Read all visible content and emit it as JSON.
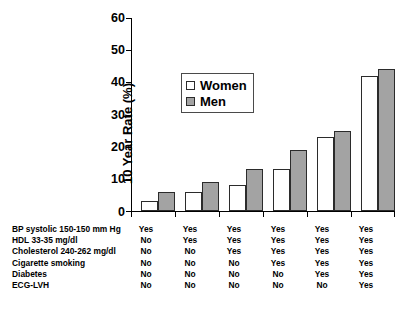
{
  "chart_data": {
    "type": "bar",
    "title": "",
    "xlabel": "",
    "ylabel": "10 Year Rate (%)",
    "ylim": [
      0,
      60
    ],
    "yticks": [
      0,
      10,
      20,
      30,
      40,
      50,
      60
    ],
    "grid": false,
    "legend_position": "inside upper-left of plot, boxed",
    "categories": [
      "1",
      "2",
      "3",
      "4",
      "5",
      "6"
    ],
    "series": [
      {
        "name": "Women",
        "values": [
          3,
          6,
          8,
          13,
          23,
          42
        ],
        "color": "#ffffff"
      },
      {
        "name": "Men",
        "values": [
          6,
          9,
          13,
          19,
          25,
          44
        ],
        "color": "#a3a3a3"
      }
    ],
    "risk_factor_table": {
      "rows": [
        {
          "label": "BP systolic 150-150 mm Hg",
          "values": [
            "Yes",
            "Yes",
            "Yes",
            "Yes",
            "Yes",
            "Yes"
          ]
        },
        {
          "label": "HDL 33-35 mg/dl",
          "values": [
            "No",
            "Yes",
            "Yes",
            "Yes",
            "Yes",
            "Yes"
          ]
        },
        {
          "label": "Cholesterol 240-262 mg/dl",
          "values": [
            "No",
            "No",
            "Yes",
            "Yes",
            "Yes",
            "Yes"
          ]
        },
        {
          "label": "Cigarette smoking",
          "values": [
            "No",
            "No",
            "No",
            "Yes",
            "Yes",
            "Yes"
          ]
        },
        {
          "label": "Diabetes",
          "values": [
            "No",
            "No",
            "No",
            "No",
            "Yes",
            "Yes"
          ]
        },
        {
          "label": "ECG-LVH",
          "values": [
            "No",
            "No",
            "No",
            "No",
            "No",
            "Yes"
          ]
        }
      ]
    }
  },
  "axis": {
    "y_title": "10 Year Rate (%)",
    "y_tick_labels": [
      "60",
      "50",
      "40",
      "30",
      "20",
      "10",
      "0"
    ]
  },
  "legend": {
    "items": [
      {
        "label": "Women",
        "swatch": "white-square-swatch"
      },
      {
        "label": "Men",
        "swatch": "gray-square-swatch"
      }
    ]
  },
  "colors": {
    "women_bar": "#ffffff",
    "men_bar": "#a3a3a3",
    "outline": "#2b2b2b",
    "axis": "#000000",
    "background": "#ffffff"
  }
}
